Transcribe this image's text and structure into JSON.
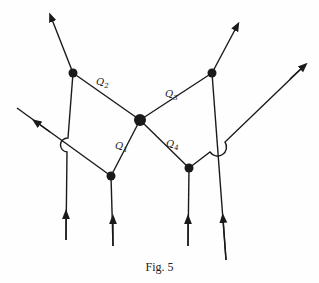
{
  "figure": {
    "caption": "Fig. 5",
    "labels": [
      {
        "id": "Q2",
        "letter": "Q",
        "sub": "2"
      },
      {
        "id": "Q3",
        "letter": "Q",
        "sub": "3"
      },
      {
        "id": "Q1",
        "letter": "Q",
        "sub": "1"
      },
      {
        "id": "Q4",
        "letter": "Q",
        "sub": "4"
      }
    ],
    "colors": {
      "ink": "#1a1a1a",
      "background": "#fefefe"
    }
  }
}
